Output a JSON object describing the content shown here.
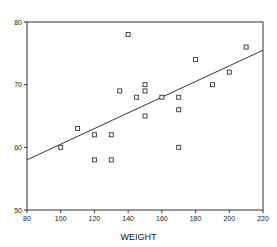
{
  "chart_data": {
    "type": "scatter",
    "title": "",
    "xlabel": "WEIGHT",
    "ylabel": "",
    "xlim": [
      80,
      220
    ],
    "ylim": [
      50,
      80
    ],
    "xticks": [
      80,
      100,
      120,
      140,
      160,
      180,
      200,
      220
    ],
    "yticks": [
      50,
      60,
      70,
      80
    ],
    "grid": false,
    "marker": "open-square",
    "points": [
      {
        "x": 100,
        "y": 60
      },
      {
        "x": 110,
        "y": 63
      },
      {
        "x": 120,
        "y": 62
      },
      {
        "x": 120,
        "y": 58
      },
      {
        "x": 130,
        "y": 62
      },
      {
        "x": 130,
        "y": 58
      },
      {
        "x": 135,
        "y": 69
      },
      {
        "x": 140,
        "y": 78
      },
      {
        "x": 145,
        "y": 68
      },
      {
        "x": 150,
        "y": 70
      },
      {
        "x": 150,
        "y": 69
      },
      {
        "x": 150,
        "y": 65
      },
      {
        "x": 160,
        "y": 68
      },
      {
        "x": 170,
        "y": 68
      },
      {
        "x": 170,
        "y": 66
      },
      {
        "x": 170,
        "y": 60
      },
      {
        "x": 180,
        "y": 74
      },
      {
        "x": 190,
        "y": 70
      },
      {
        "x": 200,
        "y": 72
      },
      {
        "x": 210,
        "y": 76
      }
    ],
    "fit_line": {
      "x": [
        80,
        220
      ],
      "y": [
        58,
        75.5
      ]
    }
  }
}
